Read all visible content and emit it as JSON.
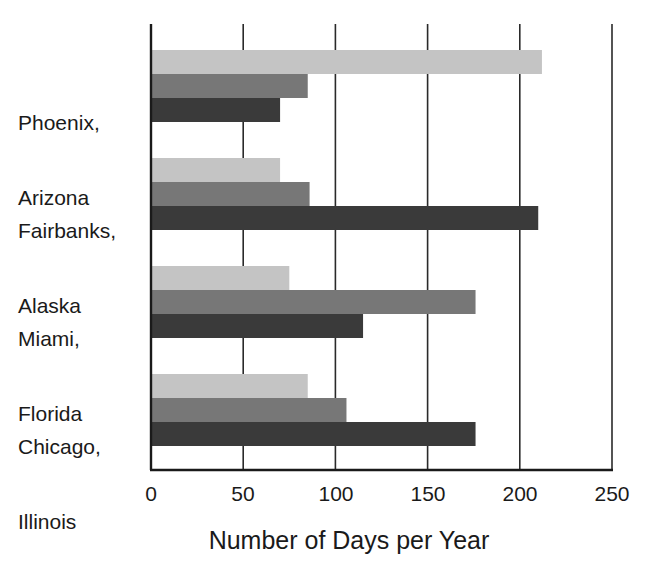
{
  "chart_data": {
    "type": "bar",
    "orientation": "horizontal",
    "title": "",
    "xlabel": "Number of Days per Year",
    "ylabel": "",
    "xlim": [
      0,
      250
    ],
    "xticks": [
      0,
      50,
      100,
      150,
      200,
      250
    ],
    "grid": "vertical",
    "legend": null,
    "categories": [
      "Phoenix, Arizona",
      "Fairbanks, Alaska",
      "Miami, Florida",
      "Chicago, Illinois"
    ],
    "category_lines": [
      [
        "Phoenix,",
        "Arizona"
      ],
      [
        "Fairbanks,",
        "Alaska"
      ],
      [
        "Miami,",
        "Florida"
      ],
      [
        "Chicago,",
        "Illinois"
      ]
    ],
    "series": [
      {
        "name": "light series",
        "color": "#c4c4c4",
        "values": [
          212,
          70,
          75,
          85
        ]
      },
      {
        "name": "medium series",
        "color": "#777777",
        "values": [
          85,
          86,
          176,
          106
        ]
      },
      {
        "name": "dark series",
        "color": "#3a3a3a",
        "values": [
          70,
          210,
          115,
          176
        ]
      }
    ]
  }
}
